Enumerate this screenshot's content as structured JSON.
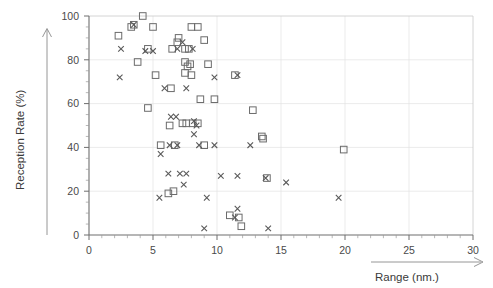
{
  "chart_data": {
    "type": "scatter",
    "title": "",
    "xlabel": "Range (nm.)",
    "ylabel": "Reception Rate  (%)",
    "xlim": [
      0,
      30
    ],
    "ylim": [
      0,
      100
    ],
    "xticks": [
      0,
      5,
      10,
      15,
      20,
      25,
      30
    ],
    "yticks": [
      0,
      20,
      40,
      60,
      80,
      100
    ],
    "xtick_labels": [
      "0",
      "5",
      "10",
      "15",
      "20",
      "25",
      "30"
    ],
    "ytick_labels": [
      "0",
      "20",
      "40",
      "60",
      "80",
      "100"
    ],
    "x_minor_interval": 1,
    "y_minor_interval": 5,
    "grid": true,
    "grid_interval_x": 5,
    "grid_interval_y": 20,
    "legend": null,
    "series": [
      {
        "name": "squares",
        "marker": "open-square",
        "color": "#6b6b6b",
        "points": [
          [
            2.3,
            91
          ],
          [
            3.3,
            95
          ],
          [
            3.5,
            96
          ],
          [
            4.2,
            100
          ],
          [
            5.0,
            95
          ],
          [
            4.6,
            85
          ],
          [
            6.9,
            88
          ],
          [
            7.0,
            90
          ],
          [
            8.0,
            95
          ],
          [
            8.5,
            95
          ],
          [
            3.8,
            79
          ],
          [
            5.2,
            73
          ],
          [
            6.5,
            85
          ],
          [
            7.5,
            85
          ],
          [
            7.8,
            85
          ],
          [
            9.0,
            89
          ],
          [
            7.5,
            79
          ],
          [
            7.7,
            77
          ],
          [
            7.9,
            78
          ],
          [
            7.5,
            74
          ],
          [
            8.0,
            73
          ],
          [
            9.3,
            78
          ],
          [
            11.4,
            73
          ],
          [
            4.6,
            58
          ],
          [
            6.4,
            67
          ],
          [
            8.7,
            62
          ],
          [
            9.8,
            62
          ],
          [
            12.8,
            57
          ],
          [
            6.3,
            50
          ],
          [
            7.3,
            51
          ],
          [
            7.6,
            51
          ],
          [
            8.1,
            51
          ],
          [
            8.5,
            51
          ],
          [
            5.6,
            41
          ],
          [
            6.7,
            41
          ],
          [
            9.0,
            41
          ],
          [
            13.5,
            45
          ],
          [
            13.6,
            44
          ],
          [
            19.9,
            39
          ],
          [
            13.9,
            26
          ],
          [
            6.2,
            19
          ],
          [
            6.6,
            20
          ],
          [
            11.0,
            9
          ],
          [
            11.7,
            8
          ],
          [
            11.9,
            4
          ]
        ]
      },
      {
        "name": "crosses",
        "marker": "x-cross",
        "color": "#5a5a5a",
        "points": [
          [
            3.5,
            96
          ],
          [
            7.3,
            88
          ],
          [
            2.5,
            85
          ],
          [
            4.4,
            84
          ],
          [
            5.0,
            84
          ],
          [
            6.9,
            85
          ],
          [
            8.1,
            85
          ],
          [
            2.4,
            72
          ],
          [
            9.8,
            72
          ],
          [
            11.6,
            73
          ],
          [
            5.9,
            67
          ],
          [
            7.6,
            67
          ],
          [
            6.4,
            54
          ],
          [
            6.8,
            54
          ],
          [
            8.2,
            52
          ],
          [
            8.4,
            50
          ],
          [
            8.2,
            46
          ],
          [
            6.3,
            41
          ],
          [
            6.9,
            41
          ],
          [
            8.6,
            41
          ],
          [
            9.8,
            41
          ],
          [
            12.6,
            41
          ],
          [
            5.6,
            37
          ],
          [
            6.2,
            28
          ],
          [
            7.1,
            28
          ],
          [
            7.6,
            28
          ],
          [
            10.3,
            27
          ],
          [
            11.6,
            27
          ],
          [
            13.8,
            26
          ],
          [
            7.4,
            23
          ],
          [
            15.4,
            24
          ],
          [
            5.5,
            17
          ],
          [
            9.2,
            17
          ],
          [
            19.5,
            17
          ],
          [
            11.6,
            12
          ],
          [
            11.4,
            8
          ],
          [
            14.0,
            3
          ],
          [
            9.0,
            3
          ]
        ]
      }
    ]
  },
  "axes": {
    "y_arrow": "upward-arrow",
    "x_arrow": "rightward-arrow"
  }
}
